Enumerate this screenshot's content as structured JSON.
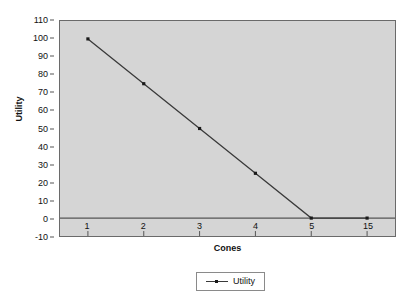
{
  "chart_data": {
    "type": "line",
    "title": "",
    "xlabel": "Cones",
    "ylabel": "Utility",
    "categories": [
      "1",
      "2",
      "3",
      "4",
      "5",
      "15"
    ],
    "series": [
      {
        "name": "Utility",
        "values": [
          100,
          75,
          50,
          25,
          0,
          0
        ]
      }
    ],
    "ylim": [
      -10,
      110
    ],
    "y_ticks": [
      "110",
      "100",
      "90",
      "80",
      "70",
      "60",
      "50",
      "40",
      "30",
      "20",
      "10",
      "0",
      "-10"
    ],
    "y_tick_values": [
      110,
      100,
      90,
      80,
      70,
      60,
      50,
      40,
      30,
      20,
      10,
      0,
      -10
    ],
    "grid": false,
    "legend_position": "bottom",
    "zero_line": true
  },
  "legend": {
    "entries": [
      {
        "label": "Utility"
      }
    ]
  },
  "colors": {
    "plot_background": "#d5d5d5",
    "plot_border": "#6a6a6a",
    "series_line": "#3a3a3a",
    "marker": "#1a1a1a",
    "axis_text": "#111111",
    "zero_line": "#555555",
    "page_background": "#ffffff"
  }
}
